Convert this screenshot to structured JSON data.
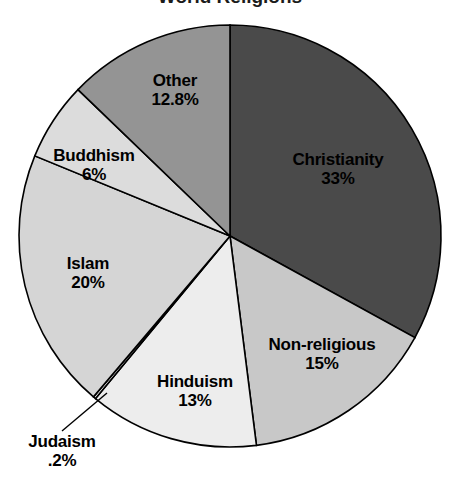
{
  "chart_data": {
    "type": "pie",
    "title": "World Religions",
    "title_visible": false,
    "xlabel": "",
    "ylabel": "",
    "legend": "none",
    "grid": false,
    "units": "percent",
    "start_angle_deg": 0,
    "direction": "clockwise",
    "categories": [
      "Christianity",
      "Non-religious",
      "Hinduism",
      "Judaism",
      "Islam",
      "Buddhism",
      "Other"
    ],
    "values": [
      33,
      15,
      13,
      0.2,
      20,
      6,
      12.8
    ],
    "value_labels": [
      "33%",
      "15%",
      "13%",
      ".2%",
      "20%",
      "6%",
      "12.8%"
    ],
    "colors": [
      "#4a4a4a",
      "#c8c8c8",
      "#ededed",
      "#f4f4f4",
      "#d5d5d5",
      "#dcdcdc",
      "#949494"
    ],
    "slices": [
      {
        "name": "Christianity",
        "value": 33,
        "value_label": "33%",
        "color": "#4a4a4a",
        "label_position": "inside"
      },
      {
        "name": "Non-religious",
        "value": 15,
        "value_label": "15%",
        "color": "#c8c8c8",
        "label_position": "inside"
      },
      {
        "name": "Hinduism",
        "value": 13,
        "value_label": "13%",
        "color": "#ededed",
        "label_position": "inside"
      },
      {
        "name": "Judaism",
        "value": 0.2,
        "value_label": ".2%",
        "color": "#f4f4f4",
        "label_position": "outside-leader"
      },
      {
        "name": "Islam",
        "value": 20,
        "value_label": "20%",
        "color": "#d5d5d5",
        "label_position": "inside"
      },
      {
        "name": "Buddhism",
        "value": 6,
        "value_label": "6%",
        "color": "#dcdcdc",
        "label_position": "inside"
      },
      {
        "name": "Other",
        "value": 12.8,
        "value_label": "12.8%",
        "color": "#949494",
        "label_position": "inside"
      }
    ],
    "geometry": {
      "center_x": 230,
      "center_y": 236,
      "radius": 211,
      "outline_color": "#000000"
    }
  }
}
